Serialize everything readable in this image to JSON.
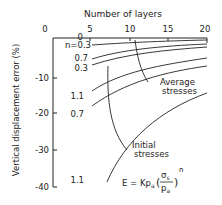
{
  "chart_data": {
    "type": "line",
    "title": "",
    "xlabel": "Number of layers",
    "ylabel": "Vertical displacement error (%)",
    "x_ticks": [
      "0",
      "5",
      "10",
      "15",
      "20"
    ],
    "y_ticks": [
      "0",
      "-10",
      "-20",
      "-30",
      "-40"
    ],
    "xlim": [
      0,
      20
    ],
    "ylim": [
      -40,
      0
    ],
    "x_axis_position": "top",
    "grid": false,
    "series": [
      {
        "name": "Average stresses, n=0.3",
        "x": [
          5,
          10,
          15,
          20
        ],
        "y": [
          -1.5,
          -0.9,
          -0.5,
          -0.2
        ]
      },
      {
        "name": "Average stresses, n=0.7",
        "x": [
          5,
          10,
          15,
          20
        ],
        "y": [
          -6,
          -3.5,
          -2.3,
          -1.6
        ]
      },
      {
        "name": "Initial stresses, n=0.3",
        "x": [
          5,
          10,
          15,
          20
        ],
        "y": [
          -7.5,
          -4.5,
          -3,
          -2
        ]
      },
      {
        "name": "Average stresses, n=1.1",
        "x": [
          5,
          10,
          15,
          20
        ],
        "y": [
          -15,
          -9.5,
          -7,
          -5.5
        ]
      },
      {
        "name": "Initial stresses, n=0.7",
        "x": [
          5,
          10,
          15,
          20
        ],
        "y": [
          -20,
          -13,
          -9.5,
          -7.5
        ]
      },
      {
        "name": "Initial stresses, n=1.1",
        "x": [
          5,
          10,
          15,
          20
        ],
        "y": [
          -39,
          -26,
          -19.5,
          -15
        ]
      }
    ],
    "curve_labels": [
      "n=0.3",
      "0.7",
      "0.3",
      "1.1",
      "0.7",
      "1.1"
    ],
    "annotations": [
      "Average stresses",
      "Initial stresses"
    ],
    "equation": {
      "lhs": "E",
      "eq": "=",
      "k": "Kp",
      "k_sub": "a",
      "num": "σ",
      "num_sub": "s",
      "den": "p",
      "den_sub": "a",
      "exp": "n"
    }
  }
}
